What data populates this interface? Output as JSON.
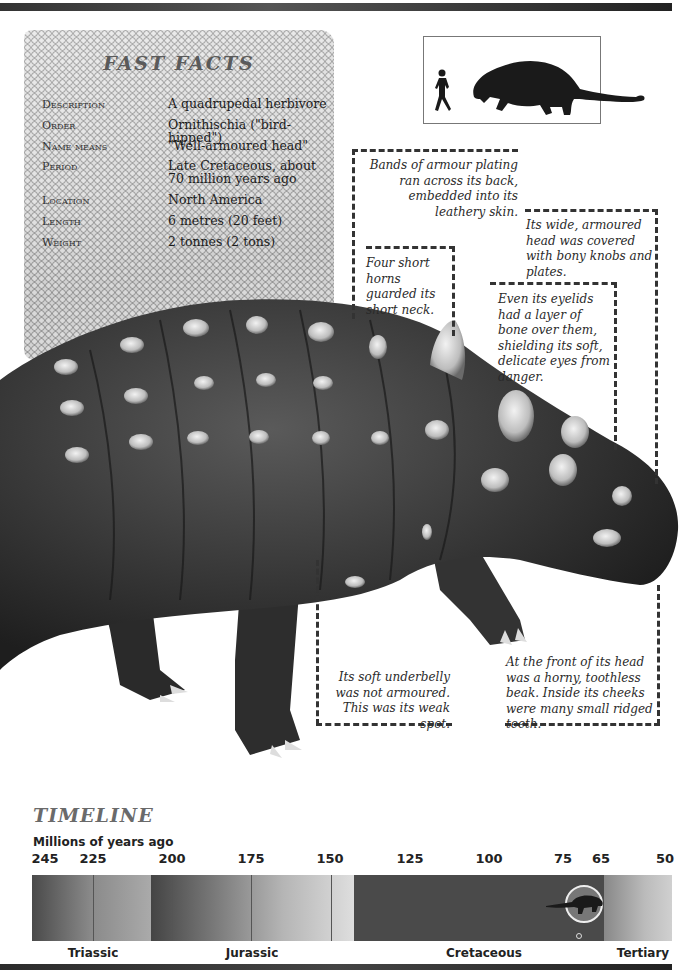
{
  "colors": {
    "top_bar": "#3a3a3a",
    "dashed_line": "#333333",
    "facts_title": "#5a5a5a",
    "timeline_title": "#6a6a6a"
  },
  "fast_facts": {
    "title": "FAST FACTS",
    "rows": [
      {
        "label": "Description",
        "value": "A quadrupedal herbivore"
      },
      {
        "label": "Order",
        "value": "Ornithischia (\"bird-hipped\")"
      },
      {
        "label": "Name means",
        "value": "\"Well-armoured head\""
      },
      {
        "label": "Period",
        "value": "Late Cretaceous, about 70 million years ago"
      },
      {
        "label": "Location",
        "value": "North America"
      },
      {
        "label": "Length",
        "value": "6 metres (20 feet)"
      },
      {
        "label": "Weight",
        "value": "2 tonnes (2 tons)"
      }
    ]
  },
  "scale_box": {
    "icons": [
      "human-silhouette-icon",
      "ankylosaur-silhouette-icon"
    ]
  },
  "callouts": {
    "armour_bands": "Bands of armour plating ran across its back, embedded into its leathery skin.",
    "head": "Its wide, armoured head was covered with bony knobs and plates.",
    "horns": "Four short horns guarded its short neck.",
    "eyelids": "Even its eyelids had a layer of bone over them, shielding its soft, delicate eyes from danger.",
    "underbelly": "Its soft underbelly was not armoured. This was its weak spot.",
    "beak": "At the front of its head was a horny, toothless beak. Inside its cheeks were many small ridged teeth."
  },
  "timeline": {
    "title": "TIMELINE",
    "subtitle": "Millions of years ago",
    "ticks": [
      "245",
      "225",
      "200",
      "175",
      "150",
      "125",
      "100",
      "75",
      "65",
      "50"
    ],
    "eras": [
      "Triassic",
      "Jurassic",
      "Cretaceous",
      "Tertiary"
    ],
    "marker": "ankylosaur-marker-icon"
  }
}
